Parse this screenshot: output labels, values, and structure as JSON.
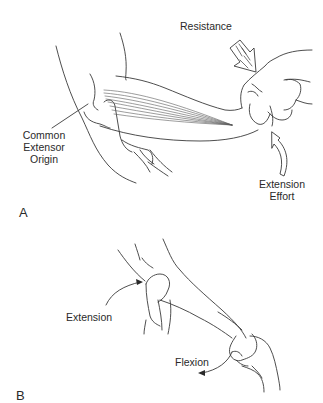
{
  "figure": {
    "panels": [
      {
        "letter": "A",
        "description": "Resisted wrist extension test with palpation of common extensor origin",
        "labels": {
          "resistance": "Resistance",
          "common_extensor_origin": [
            "Common",
            "Extensor",
            "Origin"
          ],
          "extension_effort": [
            "Extension",
            "Effort"
          ]
        }
      },
      {
        "letter": "B",
        "description": "Passive wrist flexion with elbow extension",
        "labels": {
          "extension": "Extension",
          "flexion": "Flexion"
        }
      }
    ],
    "colors": {
      "background": "#ffffff",
      "line": "#3a3a3a",
      "text": "#2a2a2a"
    }
  }
}
